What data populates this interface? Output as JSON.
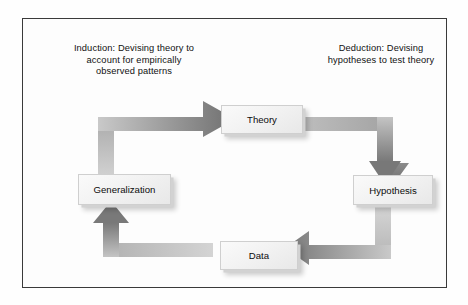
{
  "diagram": {
    "type": "cycle",
    "frame_border_color": "#3a3a3a",
    "background_color": "#fefefe",
    "arrow_color_light": "#d8d8d8",
    "arrow_color_dark": "#7d7d7d",
    "node_fill_color": "#f2f2f2",
    "captions": [
      {
        "id": "induction",
        "text": "Induction: Devising theory to account for empirically observed patterns"
      },
      {
        "id": "deduction",
        "text": "Deduction: Devising hypotheses to test theory"
      }
    ],
    "nodes": [
      {
        "id": "theory",
        "label": "Theory"
      },
      {
        "id": "hypothesis",
        "label": "Hypothesis"
      },
      {
        "id": "data",
        "label": "Data"
      },
      {
        "id": "generalization",
        "label": "Generalization"
      }
    ],
    "edges": [
      {
        "id": "generalization-to-theory",
        "from": "generalization",
        "to": "theory",
        "shape": "elbow-up-right",
        "direction": "right"
      },
      {
        "id": "theory-to-hypothesis",
        "from": "theory",
        "to": "hypothesis",
        "shape": "elbow-right-down",
        "direction": "down"
      },
      {
        "id": "hypothesis-to-data",
        "from": "hypothesis",
        "to": "data",
        "shape": "elbow-down-left",
        "direction": "left"
      },
      {
        "id": "data-to-generalization",
        "from": "data",
        "to": "generalization",
        "shape": "elbow-left-up",
        "direction": "up"
      }
    ]
  }
}
